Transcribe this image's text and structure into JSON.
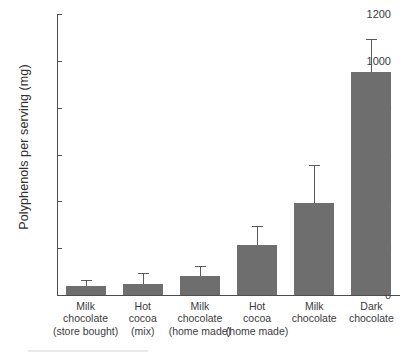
{
  "chart_data": {
    "type": "bar",
    "title": "",
    "xlabel": "",
    "ylabel": "Polyphenols per serving (mg)",
    "ylim": [
      0,
      1200
    ],
    "yticks": [
      0,
      200,
      400,
      600,
      800,
      1000,
      1200
    ],
    "ytick_labels": [
      "0",
      "200",
      "400",
      "600",
      "800",
      "1000",
      "1200"
    ],
    "grid": false,
    "legend": null,
    "bar_color": "#6e6e6e",
    "error_bar_color": "#5a5a5a",
    "axis_color": "#4d4d4d",
    "categories": [
      "Milk chocolate (store bought)",
      "Hot cocoa (mix)",
      "Milk chocolate (home made)",
      "Hot cocoa (home made)",
      "Milk chocolate",
      "Dark chocolate"
    ],
    "category_lines": [
      [
        "Milk",
        "chocolate",
        "(store bought)"
      ],
      [
        "Hot",
        "cocoa",
        "(mix)"
      ],
      [
        "Milk",
        "chocolate",
        "(home made)"
      ],
      [
        "Hot",
        "cocoa",
        "(home made)"
      ],
      [
        "Milk",
        "chocolate"
      ],
      [
        "Dark",
        "chocolate"
      ]
    ],
    "values": [
      38,
      47,
      81,
      213,
      393,
      953
    ],
    "error_high": [
      60,
      90,
      120,
      290,
      551,
      1089
    ],
    "errors": [
      22,
      43,
      39,
      77,
      158,
      136
    ]
  }
}
